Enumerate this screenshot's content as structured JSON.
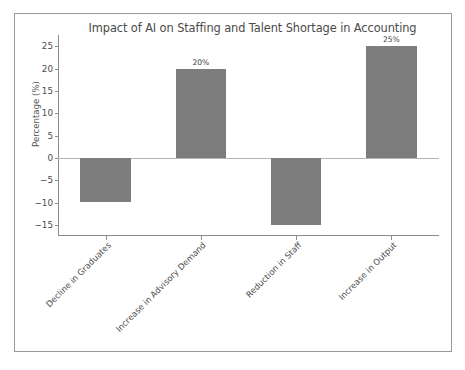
{
  "chart_data": {
    "type": "bar",
    "title": "Impact of AI on Staffing and Talent Shortage in Accounting",
    "xlabel": "",
    "ylabel": "Percentage (%)",
    "categories": [
      "Decline in Graduates",
      "Increase in Advisory Demand",
      "Reduction in Staff",
      "Increase in Output"
    ],
    "values": [
      -10,
      20,
      -15,
      25
    ],
    "point_labels": [
      "",
      "20%",
      "",
      "25%"
    ],
    "ylim": [
      -17.5,
      27.5
    ],
    "yticks": [
      25,
      20,
      15,
      10,
      5,
      0,
      -5,
      -10,
      -15
    ],
    "ytick_labels": [
      "25",
      "20",
      "15",
      "10",
      "5",
      "0",
      "−5",
      "−10",
      "−15"
    ],
    "grid": false,
    "legend": false,
    "legend_position": "none",
    "bar_color": "#7d7d7d",
    "axis_color": "#8d8d8d",
    "text_color": "#4c4c4c",
    "title_color": "#4a4a4a",
    "background_color": "#ffffff",
    "frame_color": "#9a9a9a"
  }
}
